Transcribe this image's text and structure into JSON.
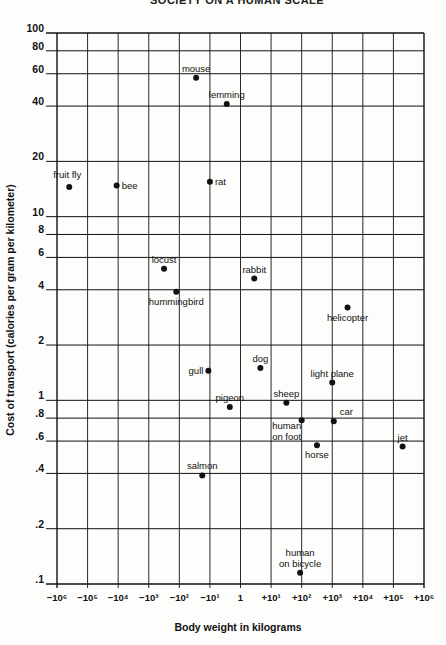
{
  "page": {
    "header": "SOCIETY ON A HUMAN SCALE"
  },
  "chart_data": {
    "type": "scatter",
    "title": "",
    "xlabel": "Body weight in kilograms",
    "ylabel": "Cost of transport (calories per gram per kilometer)",
    "x_scale": "log",
    "y_scale": "log",
    "x_ticks": [
      "−10⁶",
      "−10⁵",
      "−10⁴",
      "−10³",
      "−10²",
      "−10¹",
      "1",
      "+10¹",
      "+10²",
      "+10³",
      "+10⁴",
      "+10⁵",
      "+10⁶"
    ],
    "x_tick_exponents": [
      -6,
      -5,
      -4,
      -3,
      -2,
      -1,
      0,
      1,
      2,
      3,
      4,
      5,
      6
    ],
    "y_ticks": [
      "100",
      "80",
      "60",
      "40",
      "20",
      "10",
      "8",
      "6",
      "4",
      "2",
      "1",
      ".8",
      ".6",
      ".4",
      ".2",
      ".1"
    ],
    "y_tick_values": [
      100,
      80,
      60,
      40,
      20,
      10,
      8,
      6,
      4,
      2,
      1,
      0.8,
      0.6,
      0.4,
      0.2,
      0.1
    ],
    "xlim_exponent": [
      -6,
      6
    ],
    "ylim": [
      0.1,
      100
    ],
    "grid": true,
    "legend": "none",
    "points": [
      {
        "label": "fruit fly",
        "x_exp": -5.6,
        "y": 14.5,
        "label_pos": "above-left"
      },
      {
        "label": "bee",
        "x_exp": -4.05,
        "y": 14.8,
        "label_pos": "right"
      },
      {
        "label": "mouse",
        "x_exp": -1.45,
        "y": 57,
        "label_pos": "above"
      },
      {
        "label": "lemming",
        "x_exp": -0.45,
        "y": 41,
        "label_pos": "above"
      },
      {
        "label": "rat",
        "x_exp": -1.0,
        "y": 15.5,
        "label_pos": "right"
      },
      {
        "label": "locust",
        "x_exp": -2.5,
        "y": 5.2,
        "label_pos": "above"
      },
      {
        "label": "hummingbird",
        "x_exp": -2.1,
        "y": 3.9,
        "label_pos": "below"
      },
      {
        "label": "rabbit",
        "x_exp": 0.45,
        "y": 4.6,
        "label_pos": "above"
      },
      {
        "label": "helicopter",
        "x_exp": 3.5,
        "y": 3.2,
        "label_pos": "below"
      },
      {
        "label": "gull",
        "x_exp": -1.05,
        "y": 1.45,
        "label_pos": "left"
      },
      {
        "label": "dog",
        "x_exp": 0.65,
        "y": 1.5,
        "label_pos": "above"
      },
      {
        "label": "light plane",
        "x_exp": 3.0,
        "y": 1.25,
        "label_pos": "above"
      },
      {
        "label": "pigeon",
        "x_exp": -0.35,
        "y": 0.92,
        "label_pos": "above"
      },
      {
        "label": "sheep",
        "x_exp": 1.5,
        "y": 0.97,
        "label_pos": "above"
      },
      {
        "label": "human on foot",
        "x_exp": 2.0,
        "y": 0.78,
        "label_pos": "below-left"
      },
      {
        "label": "car",
        "x_exp": 3.05,
        "y": 0.77,
        "label_pos": "above-right"
      },
      {
        "label": "horse",
        "x_exp": 2.5,
        "y": 0.57,
        "label_pos": "below"
      },
      {
        "label": "jet",
        "x_exp": 5.3,
        "y": 0.56,
        "label_pos": "above"
      },
      {
        "label": "salmon",
        "x_exp": -1.25,
        "y": 0.39,
        "label_pos": "above"
      },
      {
        "label": "human on bicycle",
        "x_exp": 1.95,
        "y": 0.115,
        "label_pos": "above"
      }
    ]
  },
  "colors": {
    "ink": "#111111",
    "grid": "#1a1a1a",
    "paper": "#fdfdfb"
  }
}
